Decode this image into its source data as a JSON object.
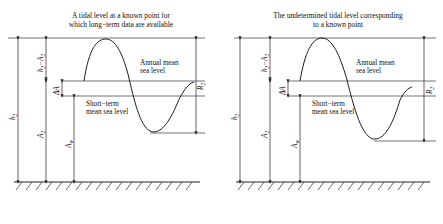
{
  "figure": {
    "panels": [
      {
        "id": "left",
        "title_line1": "A tidal level at a known point for",
        "title_line2": "which long−term data are available",
        "annual_label_line1": "Annual mean",
        "annual_label_line2": "sea level",
        "short_label_line1": "Short−term",
        "short_label_line2": "mean sea level",
        "dims": {
          "h_minus_a": {
            "base": "h",
            "base_sub": "2",
            "op": "−",
            "second": "A",
            "second_sub": "2"
          },
          "delta_a": {
            "base": "ΔA"
          },
          "h": {
            "base": "h",
            "base_sub": "2"
          },
          "a": {
            "base": "A",
            "base_sub": "2"
          },
          "a_w": {
            "base": "A",
            "base_sub": "w"
          },
          "r": {
            "base": "R",
            "base_sub": "2"
          }
        }
      },
      {
        "id": "right",
        "title_line1": "The undetermined tidal level corresponding",
        "title_line2": "to a known point",
        "annual_label_line1": "Annual mean",
        "annual_label_line2": "sea level",
        "short_label_line1": "Short−term",
        "short_label_line2": "mean sea level",
        "dims": {
          "h_minus_a": {
            "base": "h",
            "base_sub": "2",
            "op": "−",
            "second": "A",
            "second_sub": "2"
          },
          "delta_a": {
            "base": "ΔA"
          },
          "h": {
            "base": "h",
            "base_sub": "2"
          },
          "a": {
            "base": "A",
            "base_sub": "2"
          },
          "a_w": {
            "base": "A",
            "base_sub": "w"
          },
          "r": {
            "base": "R",
            "base_sub": "2"
          }
        }
      }
    ],
    "colors": {
      "line": "#1a1a1a",
      "datum": "#444444",
      "ground": "#222222",
      "background": "#ffffff"
    }
  }
}
